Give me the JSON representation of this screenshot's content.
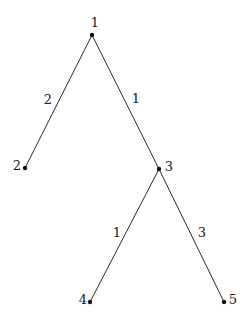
{
  "diagram": {
    "type": "tree",
    "colors": {
      "line": "#2a2a2a",
      "node": "#111111",
      "text": "#1a1a1a",
      "background": "#ffffff"
    },
    "nodes": [
      {
        "id": "1",
        "label": "1",
        "x": 92,
        "y": 35,
        "label_x": 95,
        "label_y": 22
      },
      {
        "id": "2",
        "label": "2",
        "x": 25,
        "y": 168,
        "label_x": 17,
        "label_y": 165
      },
      {
        "id": "3",
        "label": "3",
        "x": 159,
        "y": 169,
        "label_x": 169,
        "label_y": 166
      },
      {
        "id": "4",
        "label": "4",
        "x": 90,
        "y": 302,
        "label_x": 83,
        "label_y": 299
      },
      {
        "id": "5",
        "label": "5",
        "x": 224,
        "y": 302,
        "label_x": 233,
        "label_y": 299
      }
    ],
    "edges": [
      {
        "from": "1",
        "to": "2",
        "weight": "2",
        "label_x": 48,
        "label_y": 99
      },
      {
        "from": "1",
        "to": "3",
        "weight": "1",
        "label_x": 136,
        "label_y": 98
      },
      {
        "from": "3",
        "to": "4",
        "weight": "1",
        "label_x": 117,
        "label_y": 232
      },
      {
        "from": "3",
        "to": "5",
        "weight": "3",
        "label_x": 202,
        "label_y": 232
      }
    ]
  }
}
